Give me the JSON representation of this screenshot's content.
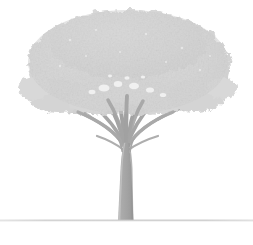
{
  "image": {
    "subject": "tree",
    "caption": "Faded light-gray photograph of a broad-canopied tree with a vase-shaped multi-stem branch structure and a thin horizontal ground line near the bottom.",
    "width": 253,
    "height": 245,
    "background_color": "#ffffff",
    "style": "low-contrast desaturated grayscale"
  },
  "palette": {
    "background": "#ffffff",
    "canopy_fill": "#d5d5d5",
    "canopy_fill_light": "#dedede",
    "canopy_fill_dark": "#cbcbcb",
    "canopy_edge": "#dadada",
    "branch": "#a8a8a8",
    "branch_light": "#b8b8b8",
    "trunk": "#a3a3a3",
    "trunk_highlight": "#bdbdbd",
    "trunk_shadow": "#9a9a9a",
    "ground_line": "#c4c4c4",
    "gap_highlight": "#f2f2f2"
  },
  "elements": {
    "canopy_label": "Tree canopy",
    "branches_label": "Branch structure",
    "trunk_label": "Tree trunk",
    "ground_label": "Ground line",
    "foliage_texture_label": "Foliage texture"
  },
  "geometry": {
    "canopy": {
      "center_x": 128,
      "center_y": 62,
      "radius_x": 104,
      "radius_y": 55,
      "top_y": 9,
      "left_x": 24,
      "right_x": 233,
      "bottom_y": 118
    },
    "trunk": {
      "base_x": 125,
      "base_y": 220,
      "base_half_width": 7.5,
      "top_y": 148,
      "top_half_width": 5.0,
      "fork_y": 140
    },
    "ground": {
      "y": 220,
      "x_start": 0,
      "x_end": 253,
      "thickness": 1.2
    },
    "branch_count": 11
  },
  "chart_data": {
    "type": "scatter",
    "title": "",
    "series": [
      {
        "name": "branch-endpoints",
        "x": [
          36,
          52,
          74,
          96,
          112,
          126,
          140,
          156,
          176,
          198,
          214
        ],
        "y": [
          110,
          98,
          90,
          86,
          84,
          82,
          84,
          87,
          92,
          100,
          112
        ]
      }
    ]
  }
}
